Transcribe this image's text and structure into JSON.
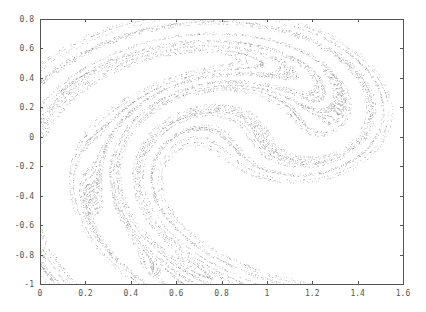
{
  "chart_data": {
    "type": "scatter",
    "title": "",
    "xlabel": "",
    "ylabel": "",
    "xlim": [
      0,
      1.6
    ],
    "ylim": [
      -1,
      0.8
    ],
    "grid": false,
    "legend": null,
    "x_ticks": [
      "0",
      "0.2",
      "0.4",
      "0.6",
      "0.8",
      "1",
      "1.2",
      "1.4",
      "1.6"
    ],
    "y_ticks": [
      "0.8",
      "0.6",
      "0.4",
      "0.2",
      "0",
      "-0.2",
      "-0.4",
      "-0.6",
      "-0.8",
      "-1"
    ],
    "x_tick_values": [
      0,
      0.2,
      0.4,
      0.6,
      0.8,
      1.0,
      1.2,
      1.4,
      1.6
    ],
    "y_tick_values": [
      0.8,
      0.6,
      0.4,
      0.2,
      0,
      -0.2,
      -0.4,
      -0.6,
      -0.8,
      -1.0
    ],
    "series": [
      {
        "name": "Ikeda attractor",
        "generator": "ikeda_map",
        "parameters": {
          "u": 0.9,
          "x0": 0.1,
          "y0": 0.1,
          "iterations": 20000,
          "discard": 100
        },
        "approx_extent": {
          "x": [
            0.1,
            1.45
          ],
          "y": [
            -0.87,
            0.7
          ]
        },
        "marker_color": "#333333",
        "marker_size": 0.6
      }
    ]
  },
  "colors": {
    "axis": "#555555",
    "background": "#ffffff",
    "points": "#333333"
  }
}
